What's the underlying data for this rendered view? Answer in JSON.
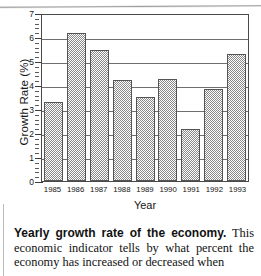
{
  "figure": {
    "ylabel": "Growth Rate (%)",
    "xlabel": "Year",
    "yticks": [
      "7",
      "6",
      "5",
      "4",
      "3",
      "2",
      "1",
      "0"
    ]
  },
  "caption": {
    "lead": "Yearly growth rate of the economy.",
    "body": " This economic indicator tells by what percent the economy has increased or decreased when"
  },
  "chart_data": {
    "type": "bar",
    "title": "Yearly growth rate of the economy",
    "xlabel": "Year",
    "ylabel": "Growth Rate (%)",
    "categories": [
      "1985",
      "1986",
      "1987",
      "1988",
      "1989",
      "1990",
      "1991",
      "1992",
      "1993"
    ],
    "values": [
      3.3,
      6.15,
      5.45,
      4.2,
      3.5,
      4.25,
      2.15,
      3.85,
      5.3
    ],
    "ylim": [
      0,
      7
    ],
    "ytick_step": 1,
    "grid": "horizontal",
    "legend": "none",
    "bar_fill": "#8a8a8a",
    "bar_edge": "#545454"
  }
}
